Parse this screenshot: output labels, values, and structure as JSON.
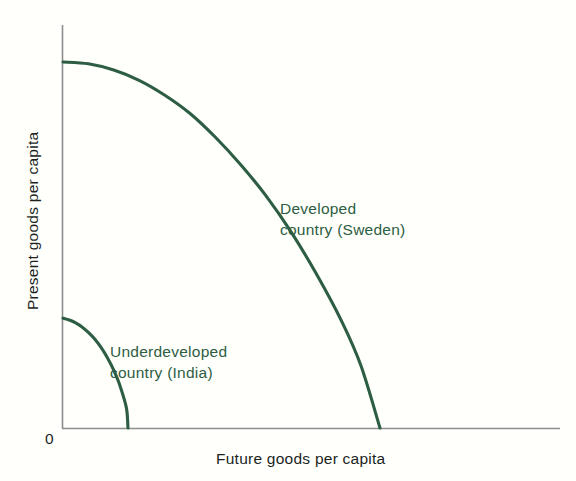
{
  "chart_data": {
    "type": "line",
    "title": "",
    "subtitle": "",
    "xlabel": "Future goods per capita",
    "ylabel": "Present goods per capita",
    "origin_label": "0",
    "grid": false,
    "legend_position": "inline-annotations",
    "axis_color": "#8d8d8d",
    "curve_color": "#2d5d43",
    "text_color": "#211f1e",
    "background_color": "#fffffc",
    "xlim": [
      0,
      1
    ],
    "ylim": [
      0,
      1
    ],
    "axis_ticks": {
      "x": [],
      "y": []
    },
    "series": [
      {
        "name": "Developed country (Sweden)",
        "label_lines": [
          "Developed",
          "country (Sweden)"
        ],
        "color": "#2d5d43",
        "x": [
          0.0,
          0.08,
          0.16,
          0.24,
          0.32,
          0.4,
          0.48,
          0.56,
          0.64,
          0.72,
          0.8,
          0.88,
          0.94,
          1.0
        ],
        "y": [
          1.0,
          0.995,
          0.978,
          0.95,
          0.91,
          0.86,
          0.795,
          0.72,
          0.635,
          0.535,
          0.42,
          0.29,
          0.17,
          0.0
        ]
      },
      {
        "name": "Underdeveloped country (India)",
        "label_lines": [
          "Underdeveloped",
          "country (India)"
        ],
        "color": "#2d5d43",
        "x": [
          0.0,
          0.02,
          0.04,
          0.06,
          0.08,
          0.1,
          0.12,
          0.14,
          0.16,
          0.18,
          0.2,
          0.205
        ],
        "y": [
          0.3,
          0.295,
          0.287,
          0.276,
          0.261,
          0.243,
          0.22,
          0.192,
          0.158,
          0.115,
          0.055,
          0.0
        ]
      }
    ],
    "annotations": [
      {
        "id": "developed",
        "lines": [
          "Developed",
          "country (Sweden)"
        ],
        "color": "#2d5d43"
      },
      {
        "id": "underdeveloped",
        "lines": [
          "Underdeveloped",
          "country (India)"
        ],
        "color": "#2d5d43"
      }
    ]
  },
  "labels": {
    "y_axis": "Present goods per capita",
    "x_axis": "Future goods per capita",
    "origin": "0",
    "developed_line1": "Developed",
    "developed_line2": "country (Sweden)",
    "underdeveloped_line1": "Underdeveloped",
    "underdeveloped_line2": "country (India)"
  }
}
